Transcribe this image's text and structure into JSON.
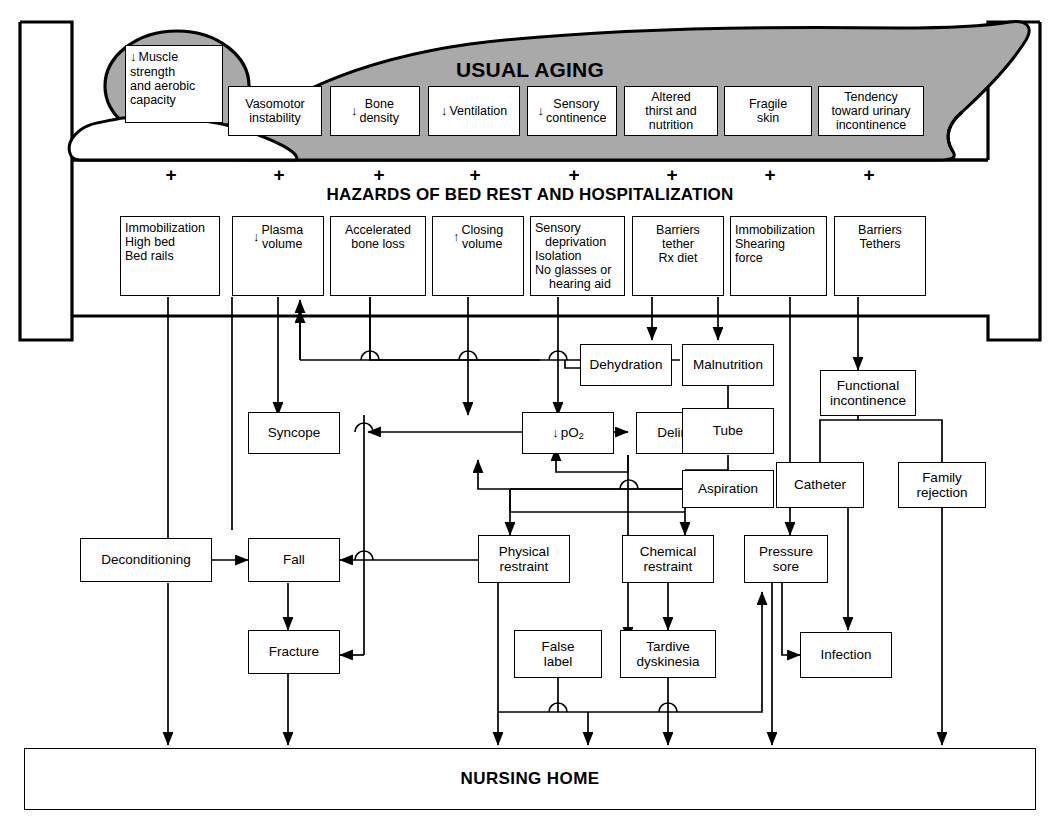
{
  "figure": {
    "type": "flowchart",
    "title_band_aging": "USUAL AGING",
    "title_band_hazards": "HAZARDS OF BED REST AND HOSPITALIZATION",
    "outcome": "NURSING HOME",
    "plus_symbol": "+",
    "colors": {
      "body_fill": "#a9a9a9",
      "line": "#000000",
      "box_fill": "#ffffff"
    }
  },
  "aging_row": [
    {
      "id": "muscle",
      "lines": [
        "Muscle",
        "strength",
        "and aerobic",
        "capacity"
      ],
      "arrow": "down",
      "align": "left"
    },
    {
      "id": "vasomotor",
      "lines": [
        "Vasomotor",
        "instability"
      ],
      "arrow": "none",
      "align": "center"
    },
    {
      "id": "bone",
      "lines": [
        "Bone",
        "density"
      ],
      "arrow": "down",
      "align": "center"
    },
    {
      "id": "ventilation",
      "lines": [
        "Ventilation"
      ],
      "arrow": "down",
      "align": "center"
    },
    {
      "id": "sensory",
      "lines": [
        "Sensory",
        "continence"
      ],
      "arrow": "down",
      "align": "center"
    },
    {
      "id": "thirst",
      "lines": [
        "Altered",
        "thirst and",
        "nutrition"
      ],
      "arrow": "none",
      "align": "center"
    },
    {
      "id": "skin",
      "lines": [
        "Fragile",
        "skin"
      ],
      "arrow": "none",
      "align": "center"
    },
    {
      "id": "urinary",
      "lines": [
        "Tendency",
        "toward urinary",
        "incontinence"
      ],
      "arrow": "none",
      "align": "center"
    }
  ],
  "hazard_row": [
    {
      "id": "immobilization1",
      "lines": [
        "Immobilization",
        "High bed",
        "Bed rails"
      ],
      "arrow": "none",
      "align": "left"
    },
    {
      "id": "plasma",
      "lines": [
        "Plasma",
        "volume"
      ],
      "arrow": "down",
      "align": "center"
    },
    {
      "id": "boneloss",
      "lines": [
        "Accelerated",
        "bone loss"
      ],
      "arrow": "none",
      "align": "center"
    },
    {
      "id": "closing",
      "lines": [
        "Closing",
        "volume"
      ],
      "arrow": "up",
      "align": "center"
    },
    {
      "id": "deprivation",
      "lines": [
        "Sensory",
        "deprivation",
        "Isolation",
        "No glasses or",
        "hearing aid"
      ],
      "arrow": "none",
      "align": "left"
    },
    {
      "id": "barriers1",
      "lines": [
        "Barriers",
        "tether",
        "Rx diet"
      ],
      "arrow": "none",
      "align": "center"
    },
    {
      "id": "immobilization2",
      "lines": [
        "Immobilization",
        "Shearing",
        "force"
      ],
      "arrow": "none",
      "align": "left"
    },
    {
      "id": "barriers2",
      "lines": [
        "Barriers",
        "Tethers"
      ],
      "arrow": "none",
      "align": "center"
    }
  ],
  "nodes": [
    {
      "id": "dehydration",
      "lines": [
        "Dehydration"
      ]
    },
    {
      "id": "malnutrition",
      "lines": [
        "Malnutrition"
      ]
    },
    {
      "id": "functional",
      "lines": [
        "Functional",
        "incontinence"
      ]
    },
    {
      "id": "syncope",
      "lines": [
        "Syncope"
      ]
    },
    {
      "id": "po2",
      "lines": [
        "pO2"
      ],
      "arrow": "down",
      "subscript": "2",
      "base": "pO"
    },
    {
      "id": "delirium",
      "lines": [
        "Delirium"
      ]
    },
    {
      "id": "tube",
      "lines": [
        "Tube"
      ]
    },
    {
      "id": "catheter",
      "lines": [
        "Catheter"
      ]
    },
    {
      "id": "family",
      "lines": [
        "Family",
        "rejection"
      ]
    },
    {
      "id": "aspiration",
      "lines": [
        "Aspiration"
      ]
    },
    {
      "id": "deconditioning",
      "lines": [
        "Deconditioning"
      ]
    },
    {
      "id": "fall",
      "lines": [
        "Fall"
      ]
    },
    {
      "id": "physical",
      "lines": [
        "Physical",
        "restraint"
      ]
    },
    {
      "id": "chemical",
      "lines": [
        "Chemical",
        "restraint"
      ]
    },
    {
      "id": "pressure",
      "lines": [
        "Pressure",
        "sore"
      ]
    },
    {
      "id": "fracture",
      "lines": [
        "Fracture"
      ]
    },
    {
      "id": "falselabel",
      "lines": [
        "False",
        "label"
      ]
    },
    {
      "id": "tardive",
      "lines": [
        "Tardive",
        "dyskinesia"
      ]
    },
    {
      "id": "infection",
      "lines": [
        "Infection"
      ]
    }
  ]
}
